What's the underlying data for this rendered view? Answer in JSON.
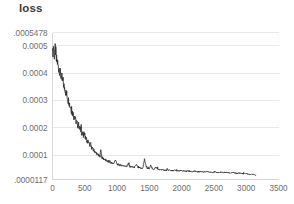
{
  "chart_data": {
    "type": "line",
    "title": "loss",
    "xlabel": "",
    "ylabel": "",
    "grid": true,
    "legend": false,
    "legend_position": "none",
    "line_color": "#2f2f2f",
    "grid_color": "#e4e4e4",
    "background_color": "#ffffff",
    "xlim": [
      0,
      3500
    ],
    "ylim": [
      1.17e-05,
      0.0005478
    ],
    "xticks": [
      0,
      500,
      1000,
      1500,
      2000,
      2500,
      3000,
      3500
    ],
    "xtick_labels": [
      "0",
      "500",
      "1000",
      "1500",
      "2000",
      "2500",
      "3000",
      "3500"
    ],
    "yticks": [
      1.17e-05,
      0.0001,
      0.0002,
      0.0003,
      0.0004,
      0.0005,
      0.0005478
    ],
    "ytick_labels": [
      ".0000117",
      "0.0001",
      "0.0002",
      "0.0003",
      "0.0004",
      "0.0005",
      ".0005478"
    ],
    "series": [
      {
        "name": "loss",
        "x": [
          0,
          15,
          30,
          45,
          60,
          75,
          90,
          105,
          120,
          135,
          150,
          165,
          180,
          195,
          210,
          225,
          240,
          255,
          270,
          285,
          300,
          315,
          330,
          345,
          360,
          375,
          390,
          405,
          420,
          435,
          450,
          465,
          480,
          495,
          510,
          525,
          540,
          555,
          570,
          585,
          600,
          615,
          630,
          645,
          660,
          675,
          690,
          705,
          720,
          735,
          750,
          765,
          780,
          795,
          810,
          825,
          840,
          855,
          870,
          885,
          900,
          925,
          950,
          975,
          1000,
          1025,
          1050,
          1075,
          1100,
          1125,
          1150,
          1175,
          1200,
          1225,
          1250,
          1275,
          1300,
          1325,
          1350,
          1375,
          1400,
          1425,
          1450,
          1475,
          1500,
          1525,
          1550,
          1575,
          1600,
          1650,
          1700,
          1750,
          1800,
          1850,
          1900,
          1950,
          2000,
          2050,
          2100,
          2150,
          2200,
          2250,
          2300,
          2350,
          2400,
          2450,
          2500,
          2550,
          2600,
          2650,
          2700,
          2750,
          2800,
          2850,
          2900,
          2950,
          3000,
          3050,
          3100,
          3150
        ],
        "y": [
          0.000455,
          0.000492,
          0.00047,
          0.000483,
          0.000452,
          0.000437,
          0.000425,
          0.000412,
          0.0004,
          0.000388,
          0.000376,
          0.000363,
          0.000351,
          0.00034,
          0.000328,
          0.000317,
          0.000305,
          0.000294,
          0.000283,
          0.000271,
          0.00026,
          0.00025,
          0.000242,
          0.000236,
          0.000228,
          0.000219,
          0.000212,
          0.000206,
          0.000199,
          0.000192,
          0.000186,
          0.000178,
          0.000172,
          0.000175,
          0.000166,
          0.000158,
          0.000152,
          0.000147,
          0.000141,
          0.000136,
          0.000131,
          0.000125,
          0.00012,
          0.000116,
          0.000112,
          0.000108,
          0.000105,
          0.000101,
          9.85e-05,
          9.55e-05,
          0.000108,
          9.25e-05,
          8.9e-05,
          8.62e-05,
          8.4e-05,
          8.15e-05,
          7.95e-05,
          7.75e-05,
          7.6e-05,
          7.45e-05,
          7.3e-05,
          7.12e-05,
          6.95e-05,
          7.6e-05,
          6.72e-05,
          6.55e-05,
          6.42e-05,
          6.3e-05,
          6.18e-05,
          6.08e-05,
          5.98e-05,
          6.42e-05,
          5.85e-05,
          5.75e-05,
          5.68e-05,
          5.6e-05,
          6.12e-05,
          5.48e-05,
          5.38e-05,
          5.3e-05,
          5.25e-05,
          6.9e-05,
          5.6e-05,
          5.12e-05,
          5.05e-05,
          5.72e-05,
          4.95e-05,
          4.88e-05,
          5.2e-05,
          4.78e-05,
          4.68e-05,
          4.6e-05,
          4.52e-05,
          4.48e-05,
          4.4e-05,
          4.35e-05,
          4.3e-05,
          4.24e-05,
          4.2e-05,
          4.14e-05,
          4.1e-05,
          4.06e-05,
          4e-05,
          3.96e-05,
          3.92e-05,
          3.88e-05,
          3.84e-05,
          3.8e-05,
          3.76e-05,
          3.72e-05,
          3.68e-05,
          3.62e-05,
          3.56e-05,
          3.5e-05,
          3.44e-05,
          3.36e-05,
          3.26e-05,
          3.12e-05,
          2.98e-05,
          2.88e-05
        ]
      }
    ],
    "noise_overlay": [
      0,
      1.2e-05,
      -8e-06,
      9e-06,
      -6e-06,
      4e-06,
      -5e-06,
      6e-06,
      -4e-06,
      3e-06,
      -3e-06,
      4e-06,
      -2e-06,
      5e-06,
      -4e-06,
      2e-06,
      -3e-06,
      4e-06,
      -2e-06,
      3e-06,
      -4e-06,
      6e-06,
      -3e-06,
      8e-06,
      -4e-06,
      2e-06,
      -3e-06,
      5e-06,
      -2e-06,
      3e-06,
      -4e-06,
      2e-06,
      -3e-06,
      9e-06,
      -4e-06,
      2e-06,
      -3e-06,
      4e-06,
      -2e-06,
      3e-06,
      -2e-06,
      2e-06,
      -2e-06,
      3e-06,
      -2e-06,
      2e-06,
      -1e-06,
      2e-06,
      -2e-06,
      1e-06,
      1.3e-05,
      -2e-06,
      1e-06,
      -1e-06,
      2e-06,
      -1e-06,
      1e-06,
      -1e-06,
      2e-06,
      -1e-06,
      1e-06,
      -1e-06,
      1e-06,
      8e-06,
      -1e-06,
      1e-06,
      -1e-06,
      1e-06,
      -1e-06,
      1e-06,
      -1e-06,
      6e-06,
      -1e-06,
      1e-06,
      -1e-06,
      1e-06,
      6e-06,
      -1e-06,
      1e-06,
      -1e-06,
      1e-06,
      1.7e-05,
      5e-06,
      -1e-06,
      1e-06,
      8e-06,
      -1e-06,
      1e-06,
      4e-06,
      -1e-06,
      1e-06,
      -1e-06,
      1e-06,
      -1e-06,
      1e-06,
      -1e-06,
      1e-06,
      -1e-06,
      1e-06,
      -1e-06,
      1e-06,
      -1e-06,
      1e-06,
      -1e-06,
      1e-06,
      -1e-06,
      1e-06,
      -1e-06,
      1e-06,
      -1e-06,
      1e-06,
      -1e-06,
      1e-06,
      -1e-06,
      1e-06,
      -1e-06,
      1e-06,
      -1e-06,
      1e-06,
      -1e-06,
      1e-06
    ]
  }
}
